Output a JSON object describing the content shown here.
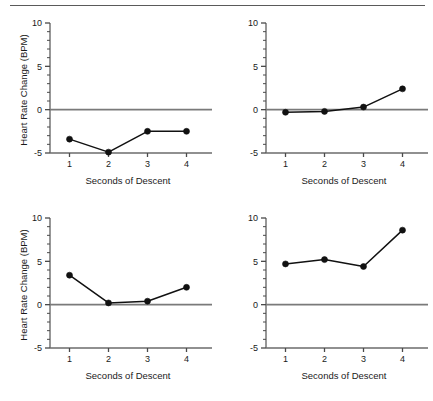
{
  "figure": {
    "top_rule": true,
    "panel_count": 4
  },
  "axis": {
    "y_tick_labels": [
      "10",
      "5",
      "0",
      "-5"
    ],
    "y_tick_values": [
      10,
      5,
      0,
      -5
    ],
    "y_minor_step": 1,
    "x_tick_labels": [
      "1",
      "2",
      "3",
      "4"
    ],
    "x_tick_values": [
      1,
      2,
      3,
      4
    ],
    "x_title": "Seconds of Descent",
    "y_title": "Heart Rate Change (BPM)"
  },
  "colors": {
    "line": "#111111",
    "marker": "#111111",
    "axis": "#6b6b6b",
    "zero_line": "#7a7a7a",
    "background": "#ffffff",
    "text": "#1a1a1a"
  },
  "chart_data": [
    {
      "type": "line",
      "panel": "top-left",
      "title": "",
      "xlabel": "Seconds of Descent",
      "ylabel": "Heart Rate Change (BPM)",
      "x": [
        1,
        2,
        3,
        4
      ],
      "values": [
        -3.4,
        -4.9,
        -2.5,
        -2.5
      ],
      "xlim": [
        0.5,
        4.5
      ],
      "ylim": [
        -5,
        10
      ],
      "yticks": [
        -5,
        0,
        5,
        10
      ],
      "xticks": [
        1,
        2,
        3,
        4
      ],
      "grid": false,
      "legend": false,
      "zero_reference_line": 0,
      "show_ylabel": true
    },
    {
      "type": "line",
      "panel": "top-right",
      "title": "",
      "xlabel": "Seconds of Descent",
      "ylabel": "",
      "x": [
        1,
        2,
        3,
        4
      ],
      "values": [
        -0.3,
        -0.2,
        0.3,
        2.4
      ],
      "xlim": [
        0.5,
        4.5
      ],
      "ylim": [
        -5,
        10
      ],
      "yticks": [
        -5,
        0,
        5,
        10
      ],
      "xticks": [
        1,
        2,
        3,
        4
      ],
      "grid": false,
      "legend": false,
      "zero_reference_line": 0,
      "show_ylabel": false
    },
    {
      "type": "line",
      "panel": "bottom-left",
      "title": "",
      "xlabel": "Seconds of Descent",
      "ylabel": "Heart Rate Change (BPM)",
      "x": [
        1,
        2,
        3,
        4
      ],
      "values": [
        3.4,
        0.2,
        0.4,
        2.0
      ],
      "xlim": [
        0.5,
        4.5
      ],
      "ylim": [
        -5,
        10
      ],
      "yticks": [
        -5,
        0,
        5,
        10
      ],
      "xticks": [
        1,
        2,
        3,
        4
      ],
      "grid": false,
      "legend": false,
      "zero_reference_line": 0,
      "show_ylabel": true
    },
    {
      "type": "line",
      "panel": "bottom-right",
      "title": "",
      "xlabel": "Seconds of Descent",
      "ylabel": "",
      "x": [
        1,
        2,
        3,
        4
      ],
      "values": [
        4.7,
        5.2,
        4.4,
        8.6
      ],
      "xlim": [
        0.5,
        4.5
      ],
      "ylim": [
        -5,
        10
      ],
      "yticks": [
        -5,
        0,
        5,
        10
      ],
      "xticks": [
        1,
        2,
        3,
        4
      ],
      "grid": false,
      "legend": false,
      "zero_reference_line": 0,
      "show_ylabel": false
    }
  ]
}
